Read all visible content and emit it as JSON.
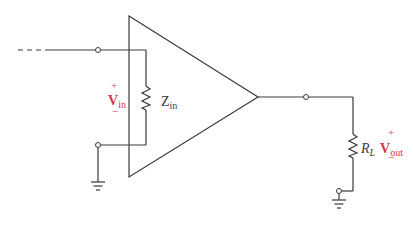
{
  "diagram": {
    "type": "amplifier input/output impedance circuit",
    "colors": {
      "wire": "#3a3a3a",
      "voltage_label": "#d8344a",
      "background": "#ffffff"
    },
    "input": {
      "voltage_label": {
        "main": "V",
        "sub": "in",
        "plus": "+",
        "minus": "−"
      },
      "impedance_label": {
        "main": "Z",
        "sub": "in"
      }
    },
    "output": {
      "voltage_label": {
        "main": "V",
        "sub": "out",
        "plus": "+",
        "minus": "−"
      },
      "load_label": {
        "main": "R",
        "sub": "L"
      }
    }
  }
}
